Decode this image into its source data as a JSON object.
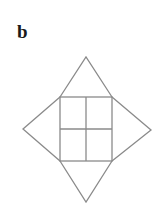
{
  "panel": {
    "label": "b"
  },
  "figure": {
    "stroke_color": "#8a8a8a",
    "background": "#ffffff",
    "square": {
      "x": 60,
      "y": 97,
      "width": 52,
      "height": 64
    },
    "grid": {
      "rows": 2,
      "cols": 2
    },
    "triangle_apexes": {
      "top": [
        86,
        57
      ],
      "left": [
        23,
        129
      ],
      "right": [
        151,
        130
      ],
      "bottom": [
        86,
        202
      ]
    }
  }
}
